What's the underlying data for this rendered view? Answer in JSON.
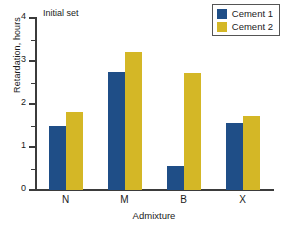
{
  "chart_data": {
    "type": "bar",
    "title": "Initial set",
    "xlabel": "Admixture",
    "ylabel": "Retardation, hours",
    "categories": [
      "N",
      "M",
      "B",
      "X"
    ],
    "series": [
      {
        "name": "Cement 1",
        "color": "#1f4e87",
        "values": [
          1.5,
          2.75,
          0.55,
          1.57
        ]
      },
      {
        "name": "Cement 2",
        "color": "#d4b726",
        "values": [
          1.82,
          3.22,
          2.71,
          1.73
        ]
      }
    ],
    "ylim": [
      0,
      4
    ],
    "y_major_ticks": [
      0,
      1,
      2,
      3,
      4
    ],
    "y_major_tick_labels": [
      "0",
      "1",
      "2",
      "3",
      "4"
    ],
    "y_minor_ticks": [
      0.5,
      1.5,
      2.5,
      3.5
    ],
    "grid": false,
    "legend_position": "top-right"
  }
}
